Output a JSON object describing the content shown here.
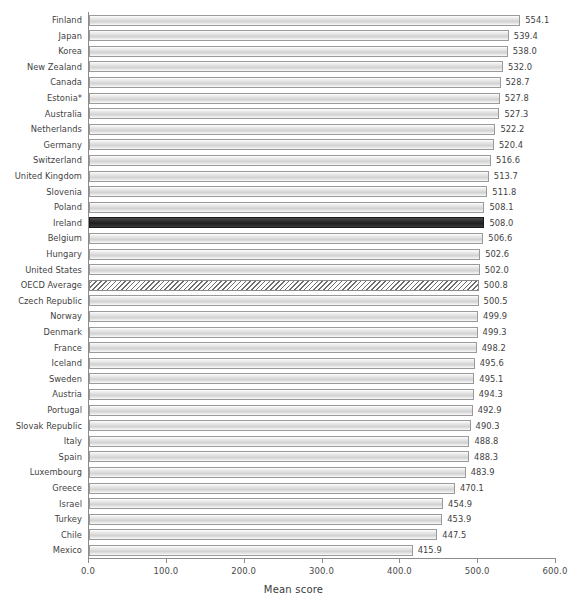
{
  "chart_data": {
    "type": "bar",
    "orientation": "horizontal",
    "title": "",
    "xlabel": "Mean score",
    "ylabel": "",
    "xlim": [
      0.0,
      600.0
    ],
    "xticks": [
      "0.0",
      "100.0",
      "200.0",
      "300.0",
      "400.0",
      "500.0",
      "600.0"
    ],
    "xtick_values": [
      0,
      100,
      200,
      300,
      400,
      500,
      600
    ],
    "grid": false,
    "legend": null,
    "categories": [
      "Finland",
      "Japan",
      "Korea",
      "New Zealand",
      "Canada",
      "Estonia*",
      "Australia",
      "Netherlands",
      "Germany",
      "Switzerland",
      "United Kingdom",
      "Slovenia",
      "Poland",
      "Ireland",
      "Belgium",
      "Hungary",
      "United States",
      "OECD Average",
      "Czech Republic",
      "Norway",
      "Denmark",
      "France",
      "Iceland",
      "Sweden",
      "Austria",
      "Portugal",
      "Slovak Republic",
      "Italy",
      "Spain",
      "Luxembourg",
      "Greece",
      "Israel",
      "Turkey",
      "Chile",
      "Mexico"
    ],
    "values": [
      554.1,
      539.4,
      538.0,
      532.0,
      528.7,
      527.8,
      527.3,
      522.2,
      520.4,
      516.6,
      513.7,
      511.8,
      508.1,
      508.0,
      506.6,
      502.6,
      502.0,
      500.8,
      500.5,
      499.9,
      499.3,
      498.2,
      495.6,
      495.1,
      494.3,
      492.9,
      490.3,
      488.8,
      488.3,
      483.9,
      470.1,
      454.9,
      453.9,
      447.5,
      415.9
    ],
    "value_labels": [
      "554.1",
      "539.4",
      "538.0",
      "532.0",
      "528.7",
      "527.8",
      "527.3",
      "522.2",
      "520.4",
      "516.6",
      "513.7",
      "511.8",
      "508.1",
      "508.0",
      "506.6",
      "502.6",
      "502.0",
      "500.8",
      "500.5",
      "499.9",
      "499.3",
      "498.2",
      "495.6",
      "495.1",
      "494.3",
      "492.9",
      "490.3",
      "488.8",
      "488.3",
      "483.9",
      "470.1",
      "454.9",
      "453.9",
      "447.5",
      "415.9"
    ],
    "styles": [
      "plain",
      "plain",
      "plain",
      "plain",
      "plain",
      "plain",
      "plain",
      "plain",
      "plain",
      "plain",
      "plain",
      "plain",
      "plain",
      "highlight",
      "plain",
      "plain",
      "plain",
      "hatched",
      "plain",
      "plain",
      "plain",
      "plain",
      "plain",
      "plain",
      "plain",
      "plain",
      "plain",
      "plain",
      "plain",
      "plain",
      "plain",
      "plain",
      "plain",
      "plain",
      "plain"
    ],
    "colors": {
      "bar_fill": "#d8d8d8",
      "bar_border": "#9a9a9a",
      "highlight_fill": "#262626",
      "hatch_stroke": "#6e6e6e",
      "axis": "#8c8c8c",
      "text": "#3f3f3f",
      "background": "#ffffff"
    }
  }
}
